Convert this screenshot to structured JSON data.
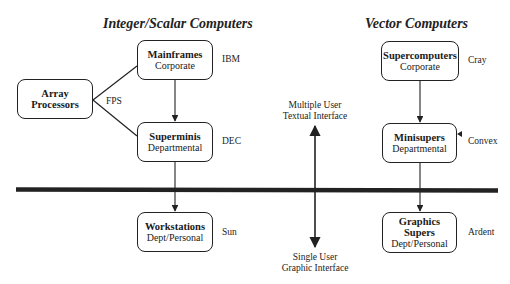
{
  "titles": {
    "left": "Integer/Scalar Computers",
    "right": "Vector Computers"
  },
  "nodes": {
    "array_processors": {
      "name": "Array",
      "name2": "Processors",
      "vendor": "FPS"
    },
    "mainframes": {
      "name": "Mainframes",
      "scope": "Corporate",
      "vendor": "IBM"
    },
    "superminis": {
      "name": "Superminis",
      "scope": "Departmental",
      "vendor": "DEC"
    },
    "workstations": {
      "name": "Workstations",
      "scope": "Dept/Personal",
      "vendor": "Sun"
    },
    "supercomputers": {
      "name": "Supercomputers",
      "scope": "Corporate",
      "vendor": "Cray"
    },
    "minisupers": {
      "name": "Minisupers",
      "scope": "Departmental",
      "vendor": "Convex"
    },
    "graphics_supers": {
      "name": "Graphics",
      "name2": "Supers",
      "scope": "Dept/Personal",
      "vendor": "Ardent"
    }
  },
  "axis": {
    "top_line1": "Multiple User",
    "top_line2": "Textual Interface",
    "bottom_line1": "Single User",
    "bottom_line2": "Graphic Interface"
  },
  "colors": {
    "ink": "#222222",
    "background": "#ffffff"
  }
}
